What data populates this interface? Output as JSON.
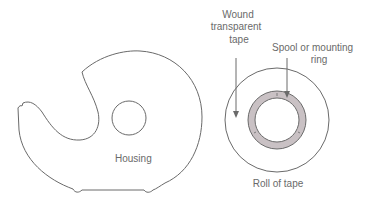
{
  "diagram": {
    "labels": {
      "housing": "Housing",
      "wound_tape_line1": "Wound",
      "wound_tape_line2": "transparent",
      "wound_tape_line3": "tape",
      "spool_line1": "Spool or mounting",
      "spool_line2": "ring",
      "roll": "Roll of tape"
    },
    "colors": {
      "outline": "#6a6a6a",
      "spool_fill": "#c9c1c4",
      "background": "#ffffff"
    }
  }
}
